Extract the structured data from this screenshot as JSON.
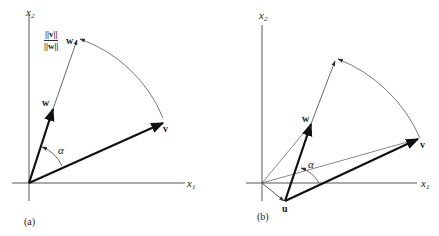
{
  "panels": [
    {
      "id": "a",
      "caption": "(a)",
      "axes": {
        "x_label": "x",
        "x_sub": "1",
        "y_label": "x",
        "y_sub": "2"
      },
      "vectors": {
        "v": "v",
        "w": "w",
        "scaled_w_num": "||v||",
        "scaled_w_den": "||w||",
        "scaled_w_tail": "w"
      },
      "angle_label": "α"
    },
    {
      "id": "b",
      "caption": "(b)",
      "axes": {
        "x_label": "x",
        "x_sub": "1",
        "y_label": "x",
        "y_sub": "2"
      },
      "vectors": {
        "v": "v",
        "w": "w",
        "u": "u"
      },
      "angle_label": "α"
    }
  ]
}
